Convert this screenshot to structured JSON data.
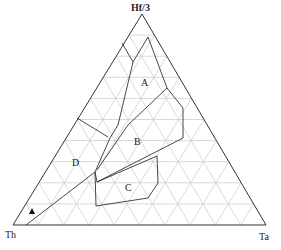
{
  "diagram": {
    "type": "ternary",
    "title": "",
    "vertices": {
      "top": "Hf/3",
      "left": "Th",
      "right": "Ta"
    },
    "grid": {
      "interval_percent": 10,
      "color": "#c8c8c8"
    },
    "regions": [
      {
        "id": "A",
        "label": "A"
      },
      {
        "id": "B",
        "label": "B"
      },
      {
        "id": "C",
        "label": "C"
      },
      {
        "id": "D",
        "label": "D"
      }
    ],
    "markers": [
      {
        "symbol": "filled-triangle",
        "label": ""
      }
    ],
    "colors": {
      "outline": "#333333",
      "grid": "#c8c8c8",
      "text": "#222222"
    }
  },
  "chart_data": {
    "type": "ternary",
    "title": "",
    "axes": [
      "Hf/3",
      "Th",
      "Ta"
    ],
    "grid": true,
    "grid_interval": 10,
    "regions": [
      "A",
      "B",
      "C",
      "D"
    ],
    "points": [
      {
        "symbol": "triangle",
        "approx_position": "near Th corner"
      }
    ]
  }
}
